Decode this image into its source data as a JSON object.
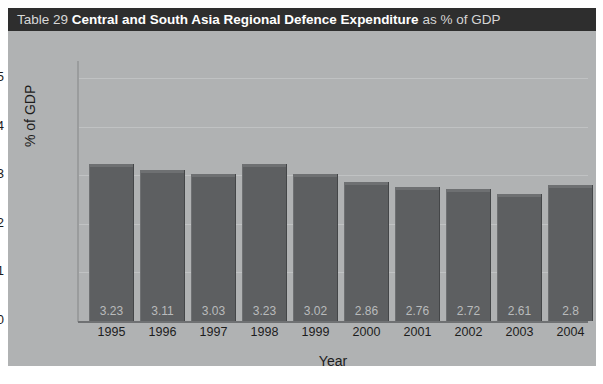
{
  "title": {
    "table_number": "Table 29",
    "main": "Central and South Asia Regional Defence Expenditure",
    "suffix": "as % of GDP"
  },
  "chart_data": {
    "type": "bar",
    "title": "Central and South Asia Regional Defence Expenditure as % of GDP",
    "xlabel": "Year",
    "ylabel": "% of GDP",
    "categories": [
      "1995",
      "1996",
      "1997",
      "1998",
      "1999",
      "2000",
      "2001",
      "2002",
      "2003",
      "2004"
    ],
    "values": [
      3.23,
      3.11,
      3.03,
      3.23,
      3.02,
      2.86,
      2.76,
      2.72,
      2.61,
      2.8
    ],
    "value_labels": [
      "3.23",
      "3.11",
      "3.03",
      "3.23",
      "3.02",
      "2.86",
      "2.76",
      "2.72",
      "2.61",
      "2.8"
    ],
    "ylim": [
      0,
      5.35
    ],
    "yticks": [
      0,
      1,
      2,
      3,
      4,
      5
    ],
    "ytick_labels": [
      "0",
      "1",
      "2",
      "3",
      "4",
      "5"
    ],
    "grid": true,
    "legend": null,
    "colors": {
      "bar_fill": "#5d5f61",
      "bar_top": "#6e7072",
      "panel_background": "#b0b2b3",
      "title_bar_background": "#2e2e2e",
      "gridline": "#c0c2c3",
      "axis": "#6f7173",
      "value_label": "#b9bbbc",
      "tick_label": "#1c1c1c"
    }
  }
}
